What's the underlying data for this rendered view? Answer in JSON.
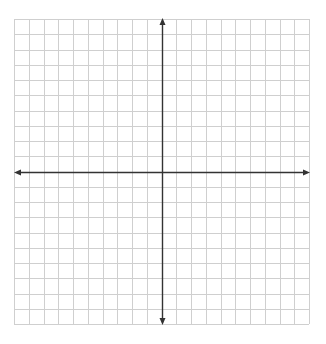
{
  "diagram": {
    "type": "coordinate-plane",
    "x_range": [
      -10,
      10
    ],
    "y_range": [
      -10,
      10
    ],
    "grid_step": 1,
    "axes": {
      "x_arrows": "both",
      "y_arrows": "both",
      "labels": false,
      "tick_labels": false
    },
    "colors": {
      "grid": "#cfcfcf",
      "axis": "#333333",
      "background": "#ffffff"
    }
  }
}
